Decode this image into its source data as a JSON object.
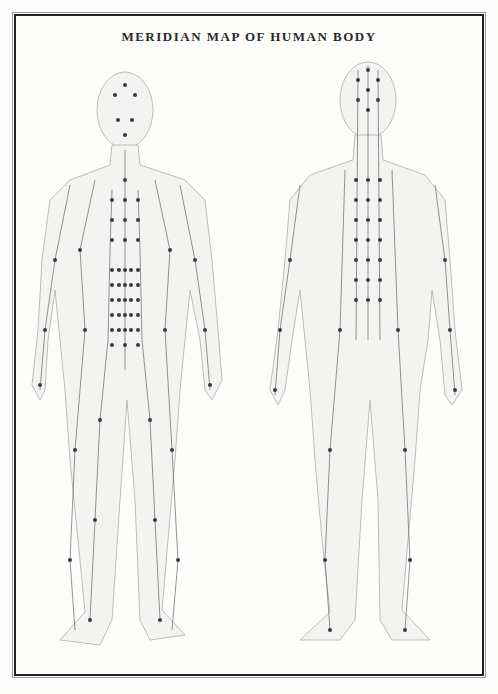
{
  "title": "MERIDIAN MAP OF HUMAN BODY",
  "figures": [
    {
      "name": "front-view",
      "label": ""
    },
    {
      "name": "back-view",
      "label": ""
    }
  ],
  "colors": {
    "line": "#555555",
    "point": "#333333",
    "body": "#e8e8e6",
    "frame": "#222222"
  }
}
